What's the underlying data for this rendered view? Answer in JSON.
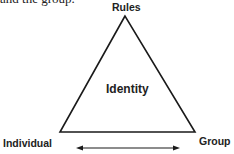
{
  "context_text": "and the group.",
  "diagram": {
    "type": "triangle",
    "vertices": {
      "top": "Rules",
      "bottom_left": "Individual",
      "bottom_right": "Group"
    },
    "center_label": "Identity",
    "arrow": {
      "type": "double-headed",
      "between": [
        "Individual",
        "Group"
      ]
    },
    "stroke_color": "#1a1a1a"
  }
}
